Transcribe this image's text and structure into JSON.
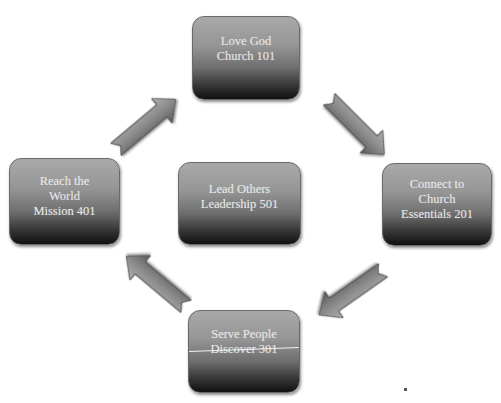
{
  "diagram": {
    "type": "cycle",
    "nodes": [
      {
        "id": "top",
        "lines": [
          "Love God",
          "Church 101"
        ]
      },
      {
        "id": "right",
        "lines": [
          "Connect to",
          "Church",
          "Essentials 201"
        ]
      },
      {
        "id": "bottom",
        "lines": [
          "Serve People",
          "Discover 301"
        ]
      },
      {
        "id": "left",
        "lines": [
          "Reach the",
          "World",
          "Mission 401"
        ]
      },
      {
        "id": "center",
        "lines": [
          "Lead Others",
          "Leadership 501"
        ]
      }
    ],
    "edges": [
      {
        "from": "top",
        "to": "right",
        "direction": "down-right"
      },
      {
        "from": "right",
        "to": "bottom",
        "direction": "down-left"
      },
      {
        "from": "bottom",
        "to": "left",
        "direction": "up-left"
      },
      {
        "from": "left",
        "to": "top",
        "direction": "up-right"
      }
    ],
    "colors": {
      "box_gradient_top": "#a9a9a9",
      "box_gradient_bottom": "#101010",
      "text": "#e6e6e6",
      "arrow": "#8a8a8a",
      "background": "#ffffff"
    }
  }
}
